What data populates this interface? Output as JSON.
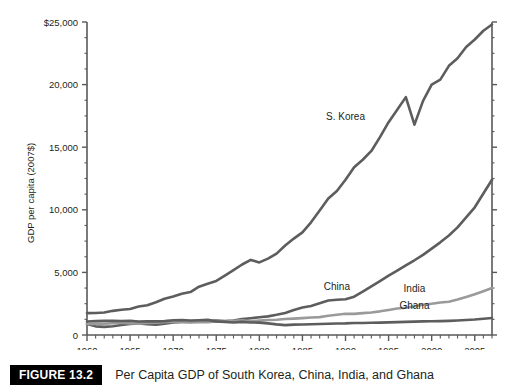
{
  "figure": {
    "badge": "FIGURE 13.2",
    "caption": "Per Capita GDP of South Korea, China, India, and Ghana"
  },
  "chart_data": {
    "type": "line",
    "title": "",
    "xlabel": "",
    "ylabel": "GDP per capita (2007$)",
    "xlim": [
      1960,
      2007
    ],
    "ylim": [
      0,
      25000
    ],
    "grid": false,
    "legend_position": "inline-annotations",
    "x_tick_labels": [
      "1960",
      "1965",
      "1970",
      "1975",
      "1980",
      "1985",
      "1990",
      "1995",
      "2000",
      "2005"
    ],
    "x_tick_values": [
      1960,
      1965,
      1970,
      1975,
      1980,
      1985,
      1990,
      1995,
      2000,
      2005
    ],
    "x_minor_tick_step": 1,
    "y_tick_labels": [
      "0",
      "5,000",
      "10,000",
      "15,000",
      "20,000",
      "$25,000"
    ],
    "y_tick_values": [
      0,
      5000,
      10000,
      15000,
      20000,
      25000
    ],
    "y_minor_tick_step": 1250,
    "x": [
      1960,
      1961,
      1962,
      1963,
      1964,
      1965,
      1966,
      1967,
      1968,
      1969,
      1970,
      1971,
      1972,
      1973,
      1974,
      1975,
      1976,
      1977,
      1978,
      1979,
      1980,
      1981,
      1982,
      1983,
      1984,
      1985,
      1986,
      1987,
      1988,
      1989,
      1990,
      1991,
      1992,
      1993,
      1994,
      1995,
      1996,
      1997,
      1998,
      1999,
      2000,
      2001,
      2002,
      2003,
      2004,
      2005,
      2006,
      2007
    ],
    "series": [
      {
        "name": "S. Korea",
        "label": "S. Korea",
        "color": "#5d5d5d",
        "label_x": 1990,
        "label_y": 17200,
        "values": [
          1750,
          1760,
          1800,
          1930,
          2020,
          2080,
          2270,
          2370,
          2610,
          2900,
          3080,
          3300,
          3430,
          3860,
          4100,
          4320,
          4740,
          5180,
          5630,
          6000,
          5800,
          6100,
          6500,
          7150,
          7700,
          8200,
          9000,
          9950,
          10900,
          11500,
          12400,
          13400,
          14000,
          14700,
          15800,
          17000,
          18000,
          19000,
          16800,
          18700,
          20000,
          20400,
          21500,
          22100,
          23000,
          23600,
          24300,
          24800
        ]
      },
      {
        "name": "China",
        "label": "China",
        "color": "#5d5d5d",
        "label_x": 1989,
        "label_y": 3600,
        "values": [
          880,
          690,
          650,
          700,
          800,
          880,
          930,
          860,
          820,
          900,
          1010,
          1050,
          1050,
          1100,
          1090,
          1150,
          1110,
          1160,
          1270,
          1340,
          1420,
          1490,
          1610,
          1760,
          1990,
          2190,
          2320,
          2530,
          2750,
          2810,
          2850,
          3060,
          3470,
          3890,
          4310,
          4740,
          5140,
          5560,
          5970,
          6400,
          6900,
          7400,
          7950,
          8600,
          9400,
          10200,
          11300,
          12400
        ]
      },
      {
        "name": "India",
        "label": "India",
        "color": "#9a9a9a",
        "label_x": 1998,
        "label_y": 3400,
        "values": [
          880,
          890,
          900,
          940,
          990,
          930,
          910,
          970,
          980,
          1020,
          1070,
          1040,
          1000,
          1030,
          1020,
          1090,
          1060,
          1130,
          1180,
          1090,
          1150,
          1200,
          1220,
          1280,
          1310,
          1350,
          1400,
          1430,
          1540,
          1620,
          1700,
          1690,
          1750,
          1800,
          1890,
          2000,
          2120,
          2180,
          2290,
          2420,
          2500,
          2590,
          2650,
          2830,
          3030,
          3250,
          3500,
          3750
        ]
      },
      {
        "name": "Ghana",
        "label": "Ghana",
        "color": "#5d5d5d",
        "label_x": 1998,
        "label_y": 2100,
        "values": [
          1080,
          1110,
          1130,
          1140,
          1120,
          1140,
          1080,
          1090,
          1090,
          1110,
          1180,
          1200,
          1160,
          1180,
          1210,
          1090,
          1040,
          1000,
          1050,
          1000,
          990,
          930,
          850,
          790,
          830,
          840,
          860,
          880,
          900,
          920,
          930,
          960,
          960,
          980,
          990,
          1010,
          1030,
          1050,
          1070,
          1090,
          1100,
          1110,
          1130,
          1160,
          1200,
          1240,
          1300,
          1360
        ]
      }
    ]
  }
}
